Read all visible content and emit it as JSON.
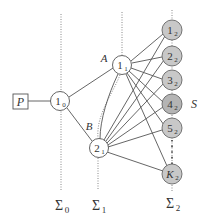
{
  "diagram": {
    "colors": {
      "line": "#555555",
      "dotted": "#777777",
      "node_white": "#ffffff",
      "node_gray": "#c8c8c8",
      "text": "#333333"
    },
    "source": {
      "label": "P"
    },
    "node_1_0": {
      "main": "1",
      "sub": "0"
    },
    "node_1_1": {
      "main": "1",
      "sub": "1"
    },
    "node_2_1": {
      "main": "2",
      "sub": "1"
    },
    "edge_labels": {
      "A": "A",
      "B": "B"
    },
    "layer2_nodes": [
      {
        "main": "1",
        "sub": "2"
      },
      {
        "main": "2",
        "sub": "2"
      },
      {
        "main": "3",
        "sub": "2"
      },
      {
        "main": "4",
        "sub": "2"
      },
      {
        "main": "5",
        "sub": "2"
      },
      {
        "main": "K",
        "sub": "2"
      }
    ],
    "set_label": "S",
    "surfaces": [
      {
        "main": "Σ",
        "sub": "0"
      },
      {
        "main": "Σ",
        "sub": "1"
      },
      {
        "main": "Σ",
        "sub": "2"
      }
    ]
  }
}
